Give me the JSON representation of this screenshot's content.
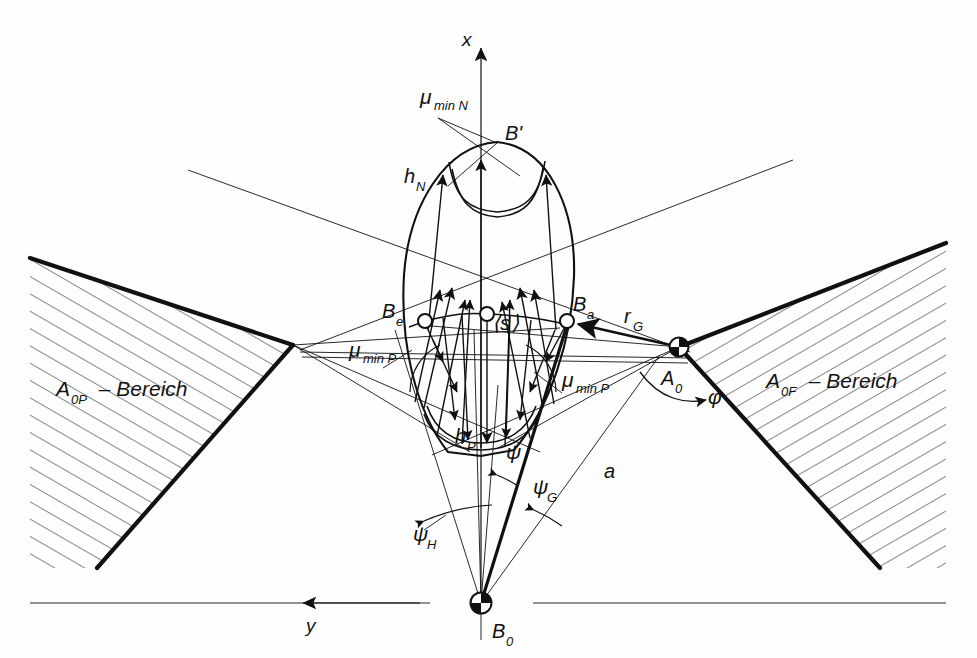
{
  "figure": {
    "background_color": "#fefefe",
    "line_color": "#111111",
    "canvas": {
      "width": 977,
      "height": 658
    }
  },
  "axes": {
    "x_axis": {
      "label": "x",
      "arrow_direction": "up",
      "x": 481,
      "tip_y": 35,
      "base_y": 603,
      "label_x": 464,
      "label_y": 44
    },
    "y_axis": {
      "label": "y",
      "arrow_direction": "left",
      "y": 603,
      "tip_x": 297,
      "base_x": 420,
      "label_x": 311,
      "label_y": 628
    },
    "origin_label": "B₀"
  },
  "points": [
    {
      "name": "B-prime",
      "label": "B'",
      "x": 497,
      "y": 142,
      "marker": "none",
      "label_x": 505,
      "label_y": 136
    },
    {
      "name": "B-e",
      "label": "B",
      "sub": "e",
      "x": 425,
      "y": 321,
      "marker": "open-circle",
      "label_x": 384,
      "label_y": 316
    },
    {
      "name": "B-a",
      "label": "B",
      "sub": "a",
      "x": 567,
      "y": 321,
      "marker": "open-circle",
      "label_x": 578,
      "label_y": 311
    },
    {
      "name": "s-mean",
      "label": "⟨s⟩",
      "x": 487,
      "y": 314,
      "marker": "open-circle",
      "label_x": 494,
      "label_y": 327
    },
    {
      "name": "A-0",
      "label": "A",
      "sub": "0",
      "x": 679,
      "y": 347,
      "marker": "quartered-circle",
      "label_x": 668,
      "label_y": 381
    },
    {
      "name": "B-0",
      "label": "B",
      "sub": "0",
      "x": 481,
      "y": 603,
      "marker": "quartered-circle",
      "label_x": 492,
      "label_y": 636
    }
  ],
  "labels": {
    "mu_min_N": {
      "text": "μ",
      "sub": "min N",
      "x": 424,
      "y": 100
    },
    "mu_min_P_left": {
      "text": "μ",
      "sub": "min P",
      "x": 352,
      "y": 353
    },
    "mu_min_P_right": {
      "text": "μ",
      "sub": "min P",
      "x": 565,
      "y": 383
    },
    "h_N": {
      "text": "h",
      "sub": "N",
      "x": 408,
      "y": 180
    },
    "h_P": {
      "text": "h",
      "sub": "P",
      "x": 459,
      "y": 440
    },
    "r_G": {
      "text": "r",
      "sub": "G",
      "x": 627,
      "y": 320
    },
    "psi": {
      "text": "ψ",
      "x": 511,
      "y": 455
    },
    "psi_G": {
      "text": "ψ",
      "sub": "G",
      "x": 538,
      "y": 490
    },
    "psi_H": {
      "text": "ψ",
      "sub": "H",
      "x": 418,
      "y": 537
    },
    "a": {
      "text": "a",
      "x": 608,
      "y": 474
    },
    "phi": {
      "text": "φ",
      "x": 712,
      "y": 399
    },
    "region_left": {
      "text": "A",
      "sub": "0P",
      "suffix": " – Bereich",
      "x": 60,
      "y": 392
    },
    "region_right": {
      "text": "A",
      "sub": "0F",
      "suffix": " – Bereich",
      "x": 770,
      "y": 384
    }
  },
  "regions": [
    {
      "name": "A_0P-Bereich",
      "label": "A₀P – Bereich",
      "side": "left",
      "vertex_x": 293,
      "vertex_y": 345,
      "hatched": true
    },
    {
      "name": "A_0F-Bereich",
      "label": "A₀F – Bereich",
      "side": "right",
      "vertex_x": 679,
      "vertex_y": 347,
      "hatched": true
    }
  ],
  "teardrop": {
    "name": "contact-field-outline",
    "apex_x": 497,
    "apex_y": 142,
    "bottom_x": 481,
    "bottom_y": 455,
    "left_x": 404,
    "right_x": 577,
    "widest_y": 300
  },
  "vectors": {
    "upward_count": 7,
    "downward_count": 7,
    "description": "field of arrows converging to B' above and to h_P below"
  }
}
